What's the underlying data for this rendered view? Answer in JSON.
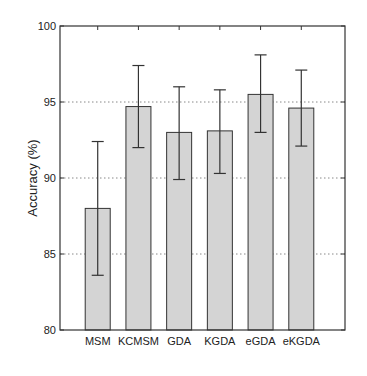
{
  "chart_data": {
    "type": "bar",
    "title": "",
    "xlabel": "",
    "ylabel": "Accuracy (%)",
    "ylim": [
      80,
      100
    ],
    "yticks": [
      80,
      85,
      90,
      95,
      100
    ],
    "grid": "horizontal dotted",
    "legend": null,
    "categories": [
      "MSM",
      "KCMSM",
      "GDA",
      "KGDA",
      "eGDA",
      "eKGDA"
    ],
    "values": [
      88.0,
      94.7,
      93.0,
      93.1,
      95.5,
      94.6
    ],
    "error_low": [
      83.6,
      92.0,
      89.9,
      90.3,
      93.0,
      92.1
    ],
    "error_high": [
      92.4,
      97.4,
      96.0,
      95.8,
      98.1,
      97.1
    ],
    "bar_color": "#d4d4d4",
    "edge_color": "#333333"
  }
}
